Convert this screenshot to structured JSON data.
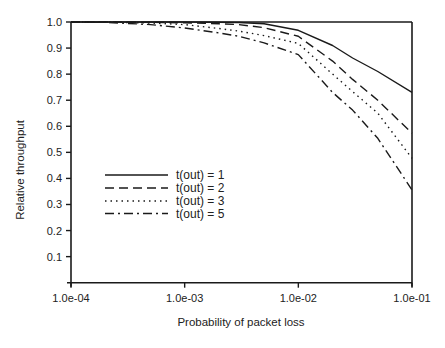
{
  "chart_data": {
    "type": "line",
    "title": "",
    "xlabel": "Probability of packet loss",
    "ylabel": "Relative throughput",
    "xscale": "log",
    "xlim": [
      0.0001,
      0.1
    ],
    "ylim": [
      0.0,
      1.0
    ],
    "grid": false,
    "legend_position": "inside-left-middle",
    "x_ticks": [
      {
        "value": 0.0001,
        "label": "1.0e-04"
      },
      {
        "value": 0.001,
        "label": "1.0e-03"
      },
      {
        "value": 0.01,
        "label": "1.0e-02"
      },
      {
        "value": 0.1,
        "label": "1.0e-01"
      }
    ],
    "y_ticks": [
      {
        "value": 0.1,
        "label": "0.1"
      },
      {
        "value": 0.2,
        "label": "0.2"
      },
      {
        "value": 0.3,
        "label": "0.3"
      },
      {
        "value": 0.4,
        "label": "0.4"
      },
      {
        "value": 0.5,
        "label": "0.5"
      },
      {
        "value": 0.6,
        "label": "0.6"
      },
      {
        "value": 0.7,
        "label": "0.7"
      },
      {
        "value": 0.8,
        "label": "0.8"
      },
      {
        "value": 0.9,
        "label": "0.9"
      },
      {
        "value": 1.0,
        "label": "1.0"
      }
    ],
    "x": [
      0.0001,
      0.0002,
      0.0005,
      0.001,
      0.002,
      0.003,
      0.005,
      0.01,
      0.02,
      0.03,
      0.05,
      0.1
    ],
    "series": [
      {
        "name": "t(out) = 1",
        "style": "solid",
        "values": [
          1.0,
          1.0,
          1.0,
          1.0,
          0.999,
          0.998,
          0.993,
          0.968,
          0.91,
          0.862,
          0.81,
          0.73
        ]
      },
      {
        "name": "t(out) = 2",
        "style": "dashed",
        "values": [
          1.0,
          1.0,
          0.999,
          0.997,
          0.993,
          0.99,
          0.978,
          0.945,
          0.85,
          0.78,
          0.7,
          0.573
        ]
      },
      {
        "name": "t(out) = 3",
        "style": "dotted",
        "values": [
          1.0,
          1.0,
          0.996,
          0.99,
          0.975,
          0.965,
          0.948,
          0.918,
          0.8,
          0.733,
          0.65,
          0.477
        ]
      },
      {
        "name": "t(out) = 5",
        "style": "dashdot",
        "values": [
          1.0,
          0.999,
          0.99,
          0.977,
          0.958,
          0.945,
          0.92,
          0.875,
          0.73,
          0.662,
          0.554,
          0.356
        ]
      }
    ]
  },
  "legend": {
    "items": [
      {
        "label": "t(out) = 1",
        "style": "solid"
      },
      {
        "label": "t(out) = 2",
        "style": "dashed"
      },
      {
        "label": "t(out) = 3",
        "style": "dotted"
      },
      {
        "label": "t(out) = 5",
        "style": "dashdot"
      }
    ]
  },
  "colors": {
    "line": "#1a1a1a",
    "axis": "#1a1a1a",
    "background": "#ffffff"
  }
}
